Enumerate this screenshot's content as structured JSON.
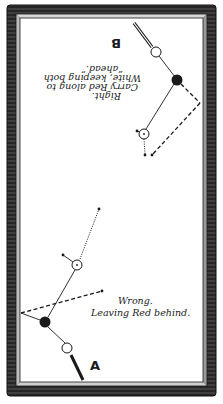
{
  "figure": {
    "colors": {
      "frame": "#2a2a2a",
      "cloth": "#ffffff",
      "ink": "#1a1a1a"
    }
  },
  "diagram_b": {
    "label": "B",
    "caption_lines": [
      "Right.",
      "Carry Red along to",
      "White, keeping both",
      "“ahead.”"
    ],
    "orientation": "upside-down"
  },
  "diagram_a": {
    "label": "A",
    "caption_lines": [
      "Wrong.",
      "Leaving Red behind."
    ]
  }
}
